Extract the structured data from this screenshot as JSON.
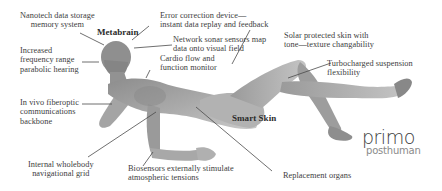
{
  "diagram": {
    "labels": {
      "nanotech": [
        "Nanotech data storage",
        "memory system"
      ],
      "metabrain": "Metabrain",
      "error_correction": [
        "Error correction device—",
        "instant data replay and feedback"
      ],
      "network_sonar": [
        "Network sonar sensors map",
        "data onto visual field"
      ],
      "hearing": [
        "Increased",
        "frequency range",
        "parabolic hearing"
      ],
      "cardio": [
        "Cardio flow and",
        "function monitor"
      ],
      "solar_skin": [
        "Solar protected skin with",
        "tone—texture changability"
      ],
      "suspension": [
        "Turbocharged suspension",
        "flexibility"
      ],
      "fiberoptic": [
        "In vivo fiberoptic",
        "communications",
        "backbone"
      ],
      "smart_skin": "Smart Skin",
      "navigation": [
        "Internal wholebody",
        "navigational grid"
      ],
      "biosensors": [
        "Biosensors externally stimulate",
        "atmospheric tensions"
      ],
      "organs": "Replacement organs"
    },
    "logo": {
      "primary": "primo",
      "secondary": "posthuman"
    },
    "colors": {
      "background": "#ffffff",
      "text": "#3d3d3d",
      "leader_line": "#4a4a4a",
      "figure": "#9a9a9a"
    }
  }
}
